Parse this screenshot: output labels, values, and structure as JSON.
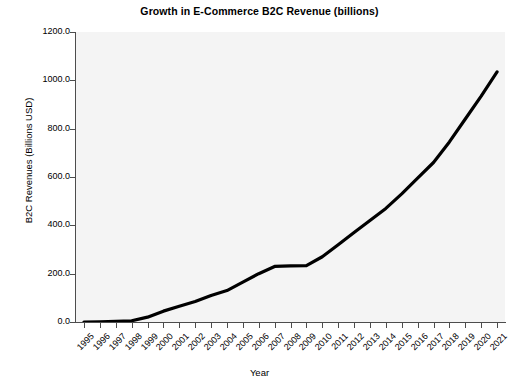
{
  "chart_data": {
    "type": "line",
    "title": "Growth in E-Commerce B2C Revenue (billions)",
    "xlabel": "Year",
    "ylabel": "B2C Revenues (Billions USD)",
    "categories": [
      "1995",
      "1996",
      "1997",
      "1998",
      "1999",
      "2000",
      "2001",
      "2002",
      "2003",
      "2004",
      "2005",
      "2006",
      "2007",
      "2008",
      "2009",
      "2010",
      "2011",
      "2012",
      "2013",
      "2014",
      "2015",
      "2016",
      "2017",
      "2018",
      "2019",
      "2020",
      "2021"
    ],
    "values": [
      0.0,
      1.0,
      2.5,
      5.0,
      20.0,
      45.0,
      65.0,
      85.0,
      110.0,
      130.0,
      165.0,
      200.0,
      230.0,
      232.0,
      233.0,
      270.0,
      320.0,
      370.0,
      420.0,
      470.0,
      530.0,
      595.0,
      660.0,
      745.0,
      840.0,
      935.0,
      1035.0
    ],
    "ylim": [
      0.0,
      1200.0
    ],
    "ytick_values": [
      0.0,
      200.0,
      400.0,
      600.0,
      800.0,
      1000.0,
      1200.0
    ],
    "ytick_labels": [
      "0.0",
      "200.0",
      "400.0",
      "600.0",
      "800.0",
      "1000.0",
      "1200.0"
    ],
    "grid": false,
    "legend": "none",
    "series_color": "#000000",
    "plot_background": "#f4f4f4",
    "axis_color": "#4d4d4d",
    "line_width": 3.2
  }
}
